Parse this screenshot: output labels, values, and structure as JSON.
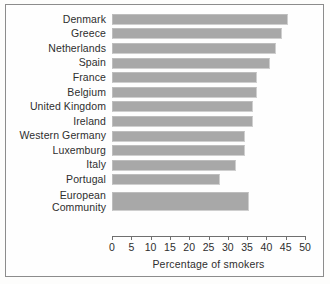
{
  "chart_data": {
    "type": "bar",
    "orientation": "horizontal",
    "title": "",
    "xlabel": "Percentage of smokers",
    "ylabel": "",
    "xlim": [
      0,
      50
    ],
    "xticks": [
      0,
      5,
      10,
      15,
      20,
      25,
      30,
      35,
      40,
      45,
      50
    ],
    "grid": false,
    "legend": null,
    "bar_color": "#a8a8a8",
    "categories": [
      "Denmark",
      "Greece",
      "Netherlands",
      "Spain",
      "France",
      "Belgium",
      "United Kingdom",
      "Ireland",
      "Western Germany",
      "Luxemburg",
      "Italy",
      "Portugal",
      "European\nCommunity"
    ],
    "values": [
      45.5,
      44,
      42.5,
      41,
      37.5,
      37.5,
      36.5,
      36.5,
      34.5,
      34.5,
      32,
      28,
      35.5
    ]
  },
  "axis": {
    "tick_labels": [
      "0",
      "5",
      "10",
      "15",
      "20",
      "25",
      "30",
      "35",
      "40",
      "45",
      "50"
    ],
    "title": "Percentage of smokers"
  },
  "rows": [
    {
      "label": "Denmark",
      "value": 45.5
    },
    {
      "label": "Greece",
      "value": 44
    },
    {
      "label": "Netherlands",
      "value": 42.5
    },
    {
      "label": "Spain",
      "value": 41
    },
    {
      "label": "France",
      "value": 37.5
    },
    {
      "label": "Belgium",
      "value": 37.5
    },
    {
      "label": "United Kingdom",
      "value": 36.5
    },
    {
      "label": "Ireland",
      "value": 36.5
    },
    {
      "label": "Western Germany",
      "value": 34.5
    },
    {
      "label": "Luxemburg",
      "value": 34.5
    },
    {
      "label": "Italy",
      "value": 32
    },
    {
      "label": "Portugal",
      "value": 28
    },
    {
      "label": "European\nCommunity",
      "value": 35.5
    }
  ]
}
